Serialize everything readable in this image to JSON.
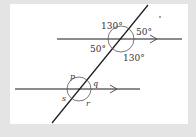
{
  "diagram": {
    "upper_intersection": {
      "angles": {
        "top_left": "130°",
        "top_right": "50°",
        "bottom_left": "50°",
        "bottom_right": "130°"
      }
    },
    "lower_intersection": {
      "angles": {
        "top_left": "p",
        "top_right": "q",
        "bottom_left": "s",
        "bottom_right": "r"
      }
    },
    "colors": {
      "background": "#e4e4e4",
      "panel": "#ffffff",
      "line": "#1a1a1a",
      "arc": "#555555"
    }
  }
}
